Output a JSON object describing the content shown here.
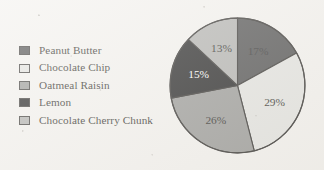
{
  "chart_data": {
    "type": "pie",
    "title": "",
    "legend_position": "left",
    "start_angle_deg": 0,
    "direction": "clockwise",
    "categories": [
      "Peanut Butter",
      "Chocolate Chip",
      "Oatmeal Raisin",
      "Lemon",
      "Chocolate Cherry Chunk"
    ],
    "values": [
      17,
      29,
      26,
      15,
      13
    ],
    "value_unit": "%",
    "data_labels": [
      "17%",
      "29%",
      "26%",
      "15%",
      "13%"
    ],
    "colors": [
      "#3b3b3b",
      "#e0e0dc",
      "#8f8f8c",
      "#0b0b0b",
      "#a9a9a6"
    ],
    "label_colors": [
      "#1a1a1a",
      "#15130f",
      "#15130f",
      "#ffffff",
      "#15130f"
    ],
    "slices": [
      {
        "name": "Peanut Butter",
        "value": 17,
        "label": "17%",
        "color": "#3b3b3b",
        "label_color": "#1a1a1a"
      },
      {
        "name": "Chocolate Chip",
        "value": 29,
        "label": "29%",
        "color": "#e0e0dc",
        "label_color": "#15130f"
      },
      {
        "name": "Oatmeal Raisin",
        "value": 26,
        "label": "26%",
        "color": "#8f8f8c",
        "label_color": "#15130f"
      },
      {
        "name": "Lemon",
        "value": 15,
        "label": "15%",
        "color": "#0b0b0b",
        "label_color": "#ffffff"
      },
      {
        "name": "Chocolate Cherry Chunk",
        "value": 13,
        "label": "13%",
        "color": "#a9a9a6",
        "label_color": "#15130f"
      }
    ]
  },
  "legend": {
    "items": [
      {
        "label": "Peanut Butter",
        "color": "#3b3b3b"
      },
      {
        "label": "Chocolate Chip",
        "color": "#e0e0dc"
      },
      {
        "label": "Oatmeal Raisin",
        "color": "#8f8f8c"
      },
      {
        "label": "Lemon",
        "color": "#0b0b0b"
      },
      {
        "label": "Chocolate Cherry Chunk",
        "color": "#a9a9a6"
      }
    ]
  },
  "style": {
    "background": "#f2f0ec",
    "outline": "#1d1b18"
  }
}
